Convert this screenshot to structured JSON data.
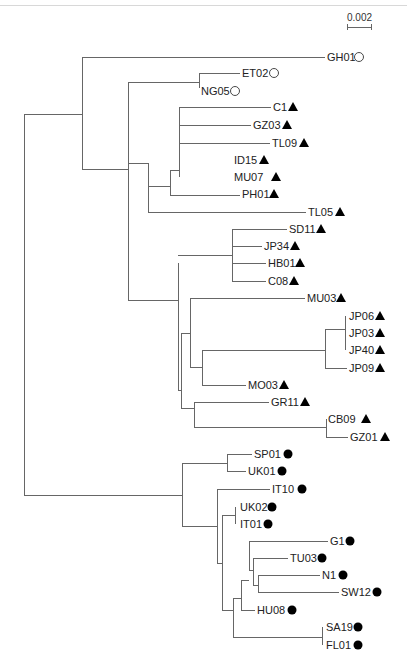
{
  "figure": {
    "type": "phylogenetic-tree",
    "scale_bar": {
      "label": "0.002",
      "x1": 347,
      "x2": 371,
      "y": 27,
      "label_y": 21
    },
    "marker_legend": {
      "open-circle": "group A",
      "filled-triangle": "group B",
      "filled-circle": "group C"
    },
    "colors": {
      "branch": "#666666",
      "text": "#222222",
      "marker": "#000000"
    }
  },
  "branches": [
    [
      24,
      114,
      24,
      495
    ],
    [
      24,
      114,
      82,
      114
    ],
    [
      82,
      57,
      82,
      169
    ],
    [
      82,
      57,
      325,
      57
    ],
    [
      82,
      169,
      128,
      169
    ],
    [
      128,
      82,
      128,
      300
    ],
    [
      128,
      82,
      199,
      82
    ],
    [
      199,
      73,
      199,
      88
    ],
    [
      199,
      73,
      240,
      73
    ],
    [
      148,
      195,
      148,
      309
    ],
    [
      128,
      195,
      148,
      195
    ],
    [
      128,
      300,
      148,
      300
    ],
    [
      148,
      195,
      195,
      195
    ],
    [
      195,
      178,
      195,
      213
    ],
    [
      195,
      213,
      242,
      213
    ],
    [
      195,
      178,
      204,
      178
    ],
    [
      204,
      160,
      204,
      198
    ],
    [
      204,
      120,
      204,
      198
    ],
    [
      204,
      120,
      240,
      120
    ],
    [
      204,
      136,
      242,
      136
    ],
    [
      204,
      155,
      262,
      155
    ],
    [
      148,
      229,
      178,
      229
    ],
    [
      178,
      229,
      178,
      245
    ],
    [
      178,
      245,
      232,
      245
    ],
    [
      178,
      229,
      188,
      229
    ]
  ],
  "leaves": [
    {
      "id": "GH01",
      "label": "GH01",
      "x": 327,
      "y": 57,
      "marker": "open-circle",
      "mx": 359
    },
    {
      "id": "ET02",
      "label": "ET02",
      "x": 242,
      "y": 73,
      "marker": "open-circle",
      "mx": 274
    },
    {
      "id": "NG05",
      "label": "NG05",
      "x": 201,
      "y": 91,
      "marker": "open-circle",
      "mx": 235
    },
    {
      "id": "C1",
      "label": "C1",
      "x": 273,
      "y": 107,
      "marker": "filled-triangle",
      "mx": 293
    },
    {
      "id": "GZ03",
      "label": "GZ03",
      "x": 253,
      "y": 125,
      "marker": "filled-triangle",
      "mx": 287
    },
    {
      "id": "TL09",
      "label": "TL09",
      "x": 272,
      "y": 143,
      "marker": "filled-triangle",
      "mx": 304
    },
    {
      "id": "ID15",
      "label": "ID15",
      "x": 234,
      "y": 160,
      "marker": "filled-triangle",
      "mx": 264
    },
    {
      "id": "MU07",
      "label": "MU07",
      "x": 234,
      "y": 177,
      "marker": "filled-triangle",
      "mx": 276
    },
    {
      "id": "PH01",
      "label": "PH01",
      "x": 242,
      "y": 194,
      "marker": "filled-triangle",
      "mx": 274
    },
    {
      "id": "TL05",
      "label": "TL05",
      "x": 308,
      "y": 212,
      "marker": "filled-triangle",
      "mx": 340
    },
    {
      "id": "SD11",
      "label": "SD11",
      "x": 289,
      "y": 229,
      "marker": "filled-triangle",
      "mx": 321
    },
    {
      "id": "JP34",
      "label": "JP34",
      "x": 264,
      "y": 246,
      "marker": "filled-triangle",
      "mx": 295
    },
    {
      "id": "HB01",
      "label": "HB01",
      "x": 268,
      "y": 263,
      "marker": "filled-triangle",
      "mx": 300
    },
    {
      "id": "C08",
      "label": "C08",
      "x": 268,
      "y": 281,
      "marker": "filled-triangle",
      "mx": 294
    },
    {
      "id": "MU03",
      "label": "MU03",
      "x": 307,
      "y": 298,
      "marker": "filled-triangle",
      "mx": 341
    },
    {
      "id": "JP06",
      "label": "JP06",
      "x": 349,
      "y": 316,
      "marker": "filled-triangle",
      "mx": 380
    },
    {
      "id": "JP03",
      "label": "JP03",
      "x": 349,
      "y": 333,
      "marker": "filled-triangle",
      "mx": 380
    },
    {
      "id": "JP40",
      "label": "JP40",
      "x": 349,
      "y": 350,
      "marker": "filled-triangle",
      "mx": 380
    },
    {
      "id": "JP09",
      "label": "JP09",
      "x": 349,
      "y": 368,
      "marker": "filled-triangle",
      "mx": 380
    },
    {
      "id": "MO03",
      "label": "MO03",
      "x": 248,
      "y": 385,
      "marker": "filled-triangle",
      "mx": 284
    },
    {
      "id": "GR11",
      "label": "GR11",
      "x": 271,
      "y": 402,
      "marker": "filled-triangle",
      "mx": 305
    },
    {
      "id": "CB09",
      "label": "CB09",
      "x": 328,
      "y": 419,
      "marker": "filled-triangle",
      "mx": 366
    },
    {
      "id": "GZ01",
      "label": "GZ01",
      "x": 350,
      "y": 437,
      "marker": "filled-triangle",
      "mx": 385
    },
    {
      "id": "SP01",
      "label": "SP01",
      "x": 254,
      "y": 454,
      "marker": "filled-circle",
      "mx": 288
    },
    {
      "id": "UK01",
      "label": "UK01",
      "x": 248,
      "y": 471,
      "marker": "filled-circle",
      "mx": 282
    },
    {
      "id": "IT10",
      "label": "IT10",
      "x": 272,
      "y": 489,
      "marker": "filled-circle",
      "mx": 302
    },
    {
      "id": "UK02",
      "label": "UK02",
      "x": 240,
      "y": 507,
      "marker": "filled-circle",
      "mx": 272
    },
    {
      "id": "IT01",
      "label": "IT01",
      "x": 240,
      "y": 524,
      "marker": "filled-circle",
      "mx": 268
    },
    {
      "id": "G1",
      "label": "G1",
      "x": 330,
      "y": 541,
      "marker": "filled-circle",
      "mx": 350
    },
    {
      "id": "TU03",
      "label": "TU03",
      "x": 290,
      "y": 558,
      "marker": "filled-circle",
      "mx": 322
    },
    {
      "id": "N1",
      "label": "N1",
      "x": 322,
      "y": 575,
      "marker": "filled-circle",
      "mx": 343
    },
    {
      "id": "SW12",
      "label": "SW12",
      "x": 341,
      "y": 592,
      "marker": "filled-circle",
      "mx": 377
    },
    {
      "id": "HU08",
      "label": "HU08",
      "x": 257,
      "y": 610,
      "marker": "filled-circle",
      "mx": 292
    },
    {
      "id": "SA19",
      "label": "SA19",
      "x": 326,
      "y": 627,
      "marker": "filled-circle",
      "mx": 358
    },
    {
      "id": "FL01",
      "label": "FL01",
      "x": 326,
      "y": 645,
      "marker": "filled-circle",
      "mx": 358
    }
  ]
}
